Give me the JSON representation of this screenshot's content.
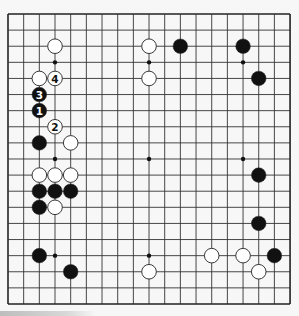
{
  "board": {
    "size": 19,
    "background": "#f7f7f7",
    "line_color": "#333333",
    "border_color": "#222222",
    "origin": {
      "x": 8,
      "y": 14
    },
    "spacing": {
      "x": 15.67,
      "y": 16.11
    },
    "star_points": [
      [
        3,
        3
      ],
      [
        9,
        3
      ],
      [
        15,
        3
      ],
      [
        3,
        9
      ],
      [
        9,
        9
      ],
      [
        15,
        9
      ],
      [
        3,
        15
      ],
      [
        9,
        15
      ],
      [
        15,
        15
      ]
    ]
  },
  "stones": [
    {
      "color": "white",
      "col": 3,
      "row": 2
    },
    {
      "color": "white",
      "col": 9,
      "row": 2
    },
    {
      "color": "black",
      "col": 11,
      "row": 2
    },
    {
      "color": "black",
      "col": 15,
      "row": 2
    },
    {
      "color": "white",
      "col": 2,
      "row": 4
    },
    {
      "color": "white",
      "col": 3,
      "row": 4,
      "label": "4"
    },
    {
      "color": "white",
      "col": 9,
      "row": 4
    },
    {
      "color": "black",
      "col": 16,
      "row": 4
    },
    {
      "color": "black",
      "col": 2,
      "row": 5,
      "label": "3"
    },
    {
      "color": "black",
      "col": 2,
      "row": 6,
      "label": "1"
    },
    {
      "color": "white",
      "col": 3,
      "row": 7,
      "label": "2"
    },
    {
      "color": "black",
      "col": 2,
      "row": 8
    },
    {
      "color": "white",
      "col": 4,
      "row": 8
    },
    {
      "color": "white",
      "col": 2,
      "row": 10
    },
    {
      "color": "white",
      "col": 3,
      "row": 10
    },
    {
      "color": "white",
      "col": 4,
      "row": 10
    },
    {
      "color": "black",
      "col": 16,
      "row": 10
    },
    {
      "color": "black",
      "col": 2,
      "row": 11
    },
    {
      "color": "black",
      "col": 3,
      "row": 11
    },
    {
      "color": "black",
      "col": 4,
      "row": 11
    },
    {
      "color": "black",
      "col": 2,
      "row": 12
    },
    {
      "color": "white",
      "col": 3,
      "row": 12
    },
    {
      "color": "black",
      "col": 16,
      "row": 13
    },
    {
      "color": "black",
      "col": 2,
      "row": 15
    },
    {
      "color": "white",
      "col": 13,
      "row": 15
    },
    {
      "color": "white",
      "col": 15,
      "row": 15
    },
    {
      "color": "black",
      "col": 17,
      "row": 15
    },
    {
      "color": "black",
      "col": 4,
      "row": 16
    },
    {
      "color": "white",
      "col": 9,
      "row": 16
    },
    {
      "color": "white",
      "col": 16,
      "row": 16
    }
  ],
  "move_labels": [
    "1",
    "2",
    "3",
    "4"
  ]
}
